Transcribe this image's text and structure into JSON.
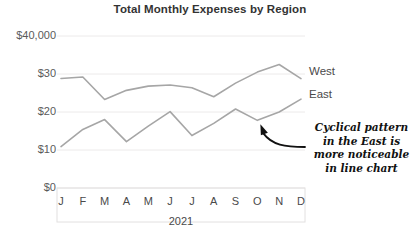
{
  "chart_data": {
    "type": "line",
    "title": "Total Monthly Expenses by Region",
    "xlabel": "2021",
    "ylabel": "",
    "categories": [
      "J",
      "F",
      "M",
      "A",
      "M",
      "J",
      "J",
      "A",
      "S",
      "O",
      "N",
      "D"
    ],
    "ytick_labels": [
      "$40,000",
      "$30",
      "$20",
      "$10",
      "$0"
    ],
    "ytick_values": [
      40,
      30,
      20,
      10,
      0
    ],
    "ylim": [
      0,
      40
    ],
    "grid": "horizontal",
    "legend_position": "right-inline",
    "series": [
      {
        "name": "West",
        "color": "#a6a6a6",
        "values": [
          28.8,
          29.2,
          23.3,
          25.7,
          26.8,
          27.1,
          26.4,
          24.0,
          27.6,
          30.5,
          32.5,
          28.8
        ]
      },
      {
        "name": "East",
        "color": "#a6a6a6",
        "values": [
          10.9,
          15.4,
          18.0,
          12.2,
          16.3,
          20.1,
          13.8,
          17.0,
          20.8,
          17.8,
          20.0,
          23.4
        ]
      }
    ],
    "annotations": [
      {
        "name": "cyclical-pattern-note",
        "lines": [
          "Cyclical pattern",
          "in the East is",
          "more noticeable",
          "in line chart"
        ],
        "arrow_color": "#111111",
        "points_to": {
          "series": "East",
          "category": "O"
        }
      }
    ]
  },
  "colors": {
    "gridline": "#eceaea",
    "axis_box": "#e2e0e0",
    "line": "#a6a6a6",
    "text": "#4a4a4a",
    "title": "#333333"
  }
}
